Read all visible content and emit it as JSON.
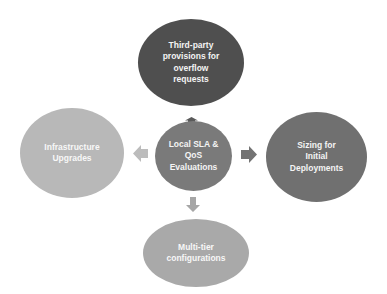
{
  "diagram": {
    "type": "radial-cycle",
    "center": {
      "label": "Local SLA & QoS Evaluations",
      "lines": [
        "Local SLA &",
        "QoS",
        "Evaluations"
      ],
      "color": "#7a7a7a"
    },
    "nodes": [
      {
        "id": "top",
        "label": "Third-party provisions for overflow requests",
        "lines": [
          "Third-party",
          "provisions for",
          "overflow",
          "requests"
        ],
        "color": "#4f4f4f"
      },
      {
        "id": "right",
        "label": "Sizing for Initial Deployments",
        "lines": [
          "Sizing for",
          "Initial",
          "Deployments"
        ],
        "color": "#707070"
      },
      {
        "id": "bottom",
        "label": "Multi-tier configurations",
        "lines": [
          "Multi-tier",
          "configurations"
        ],
        "color": "#a9a9a9"
      },
      {
        "id": "left",
        "label": "Infrastructure Upgrades",
        "lines": [
          "Infrastructure",
          "Upgrades"
        ],
        "color": "#b8b8b8"
      }
    ],
    "arrows": [
      {
        "direction": "up",
        "color": "#5a5a5a"
      },
      {
        "direction": "right",
        "color": "#737373"
      },
      {
        "direction": "down",
        "color": "#a6a6a6"
      },
      {
        "direction": "left",
        "color": "#bcbcbc"
      }
    ]
  }
}
